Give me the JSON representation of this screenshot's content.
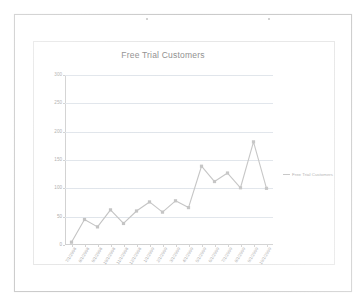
{
  "page": {
    "background_color": "#ffffff",
    "sheet_border_color": "#c9c9c9"
  },
  "chart": {
    "title": "Free Trial Customers",
    "border_color": "#e6e6e6",
    "gridline_color": "#dfe4ea",
    "axis_color": "#cfcfcf",
    "legend": {
      "position": "right",
      "entries": [
        {
          "label": "Free Trial Customers",
          "color": "#c2c2c2"
        }
      ]
    }
  },
  "chart_data": {
    "type": "line",
    "title": "Free Trial Customers",
    "xlabel": "",
    "ylabel": "",
    "grid": true,
    "legend_position": "right",
    "ylim": [
      0,
      300
    ],
    "yticks": [
      0,
      50,
      100,
      150,
      200,
      250,
      300
    ],
    "ytick_labels": [
      "0",
      "50",
      "100",
      "150",
      "200",
      "250",
      "300"
    ],
    "categories": [
      "7/1/2008",
      "8/1/2008",
      "9/1/2008",
      "10/1/2008",
      "11/1/2008",
      "12/1/2008",
      "1/1/2009",
      "2/1/2009",
      "3/1/2009",
      "4/1/2009",
      "5/1/2009",
      "6/1/2009",
      "7/1/2009",
      "8/1/2009",
      "9/1/2009",
      "10/1/2009"
    ],
    "series": [
      {
        "name": "Free Trial Customers",
        "color": "#c2c2c2",
        "marker": "square",
        "values": [
          5,
          45,
          32,
          62,
          38,
          60,
          76,
          58,
          78,
          66,
          139,
          112,
          127,
          101,
          182,
          100
        ]
      }
    ]
  }
}
